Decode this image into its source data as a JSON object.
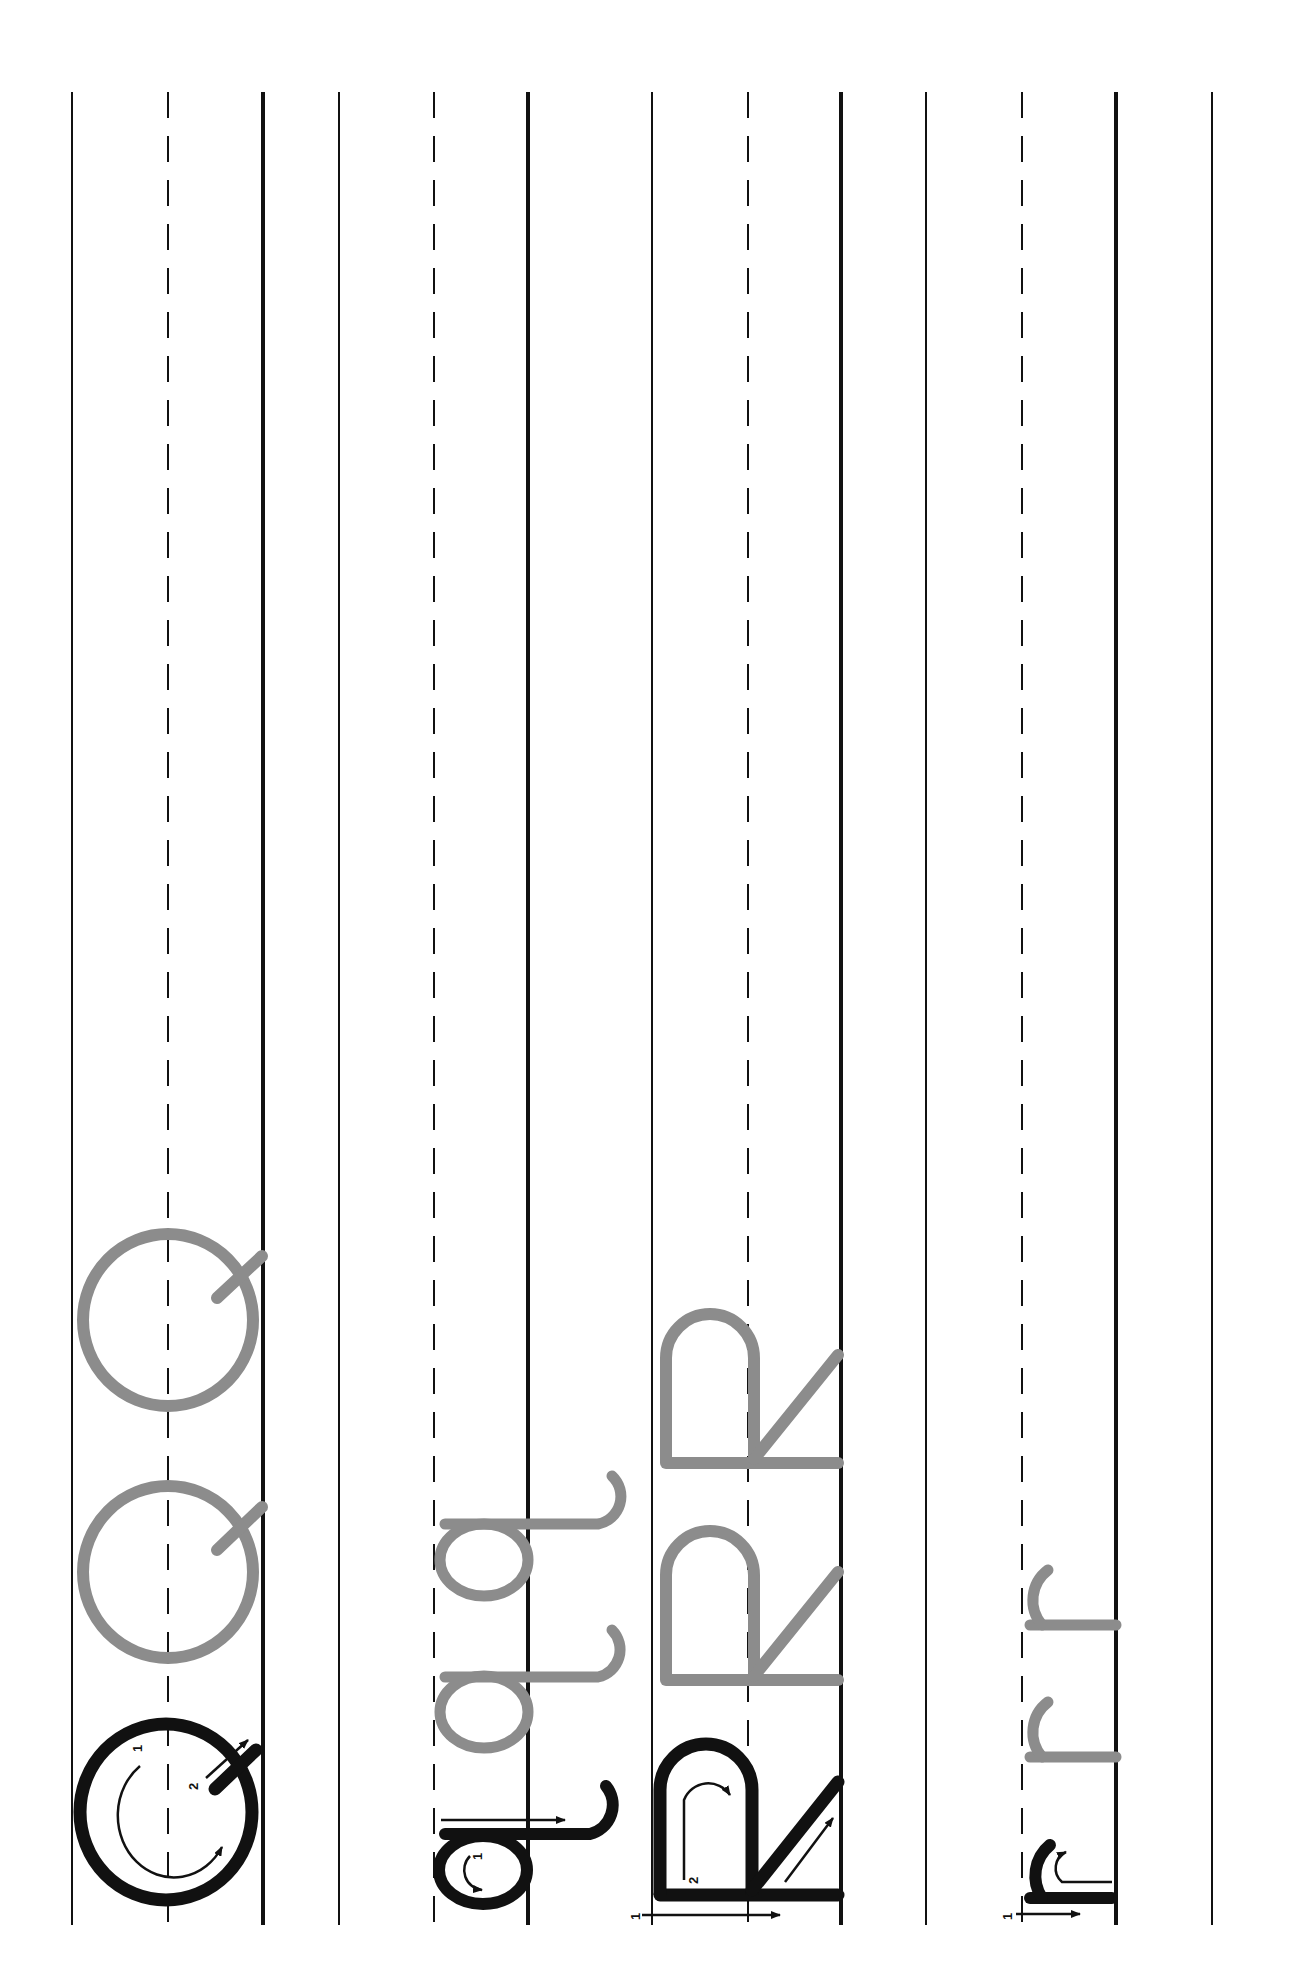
{
  "worksheet": {
    "title": "Handwriting practice: Q q R r",
    "orientation": "rotated-90-ccw",
    "rows": [
      {
        "letter": "Q",
        "case": "uppercase",
        "model_stroke_numbers": [
          "1",
          "2"
        ],
        "trace_copies": 2,
        "trace_color": "#8c8c8c"
      },
      {
        "letter": "q",
        "case": "lowercase",
        "model_stroke_numbers": [
          "1"
        ],
        "trace_copies": 2,
        "trace_color": "#8c8c8c"
      },
      {
        "letter": "R",
        "case": "uppercase",
        "model_stroke_numbers": [
          "1",
          "2"
        ],
        "trace_copies": 2,
        "trace_color": "#8c8c8c"
      },
      {
        "letter": "r",
        "case": "lowercase",
        "model_stroke_numbers": [
          "1"
        ],
        "trace_copies": 2,
        "trace_color": "#8c8c8c"
      }
    ],
    "colors": {
      "ink": "#111111",
      "trace": "#8c8c8c",
      "paper": "#ffffff"
    }
  }
}
